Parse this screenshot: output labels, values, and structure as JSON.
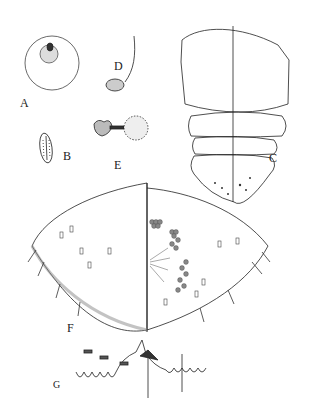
{
  "figure": {
    "panels": [
      {
        "id": "A",
        "label": "A",
        "description": "round egg with micropylar cap"
      },
      {
        "id": "B",
        "label": "B",
        "description": "elongate sculptured egg"
      },
      {
        "id": "C",
        "label": "C",
        "description": "larva, dorsal/ventral halves"
      },
      {
        "id": "D",
        "label": "D",
        "description": "stalked capsule"
      },
      {
        "id": "E",
        "label": "E",
        "description": "spiracle / gland structure"
      },
      {
        "id": "F",
        "label": "F",
        "description": "pygidium, dorsal/ventral halves"
      },
      {
        "id": "G",
        "label": "G",
        "description": "margin detail with lobes and setae"
      }
    ]
  }
}
